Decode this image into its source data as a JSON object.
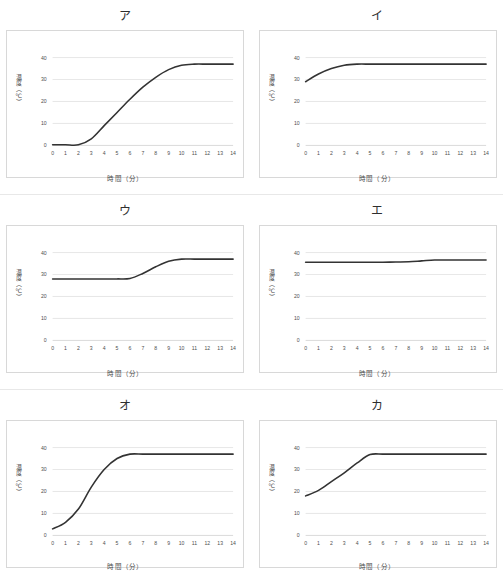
{
  "page": {
    "background_color": "#ffffff",
    "series_color": "#333333",
    "grid_color": "#d6d6d6",
    "panel_border_color": "#d8d8d8"
  },
  "common": {
    "xlabel": "時間（分）",
    "ylabel": "温度（℃）",
    "x_ticks": [
      "0",
      "1",
      "2",
      "3",
      "4",
      "5",
      "6",
      "7",
      "8",
      "9",
      "10",
      "11",
      "12",
      "13",
      "14"
    ],
    "y_ticks": [
      "0",
      "10",
      "20",
      "30",
      "40"
    ]
  },
  "chart_data": [
    {
      "type": "line",
      "title": "ア",
      "xlabel": "時間（分）",
      "ylabel": "温度（℃）",
      "xlim": [
        0,
        14
      ],
      "ylim": [
        0,
        44
      ],
      "xticks": [
        0,
        1,
        2,
        3,
        4,
        5,
        6,
        7,
        8,
        9,
        10,
        11,
        12,
        13,
        14
      ],
      "yticks": [
        0,
        10,
        20,
        30,
        40
      ],
      "grid": true,
      "legend": "none",
      "x": [
        0,
        1,
        2,
        3,
        4,
        5,
        6,
        7,
        8,
        9,
        10,
        11,
        12,
        13,
        14
      ],
      "values": [
        0.3,
        0.3,
        0.3,
        3.0,
        9.0,
        15.0,
        21.0,
        26.5,
        31.0,
        34.5,
        36.5,
        37.0,
        37.0,
        37.0,
        37.0
      ]
    },
    {
      "type": "line",
      "title": "イ",
      "xlabel": "時間（分）",
      "ylabel": "温度（℃）",
      "xlim": [
        0,
        14
      ],
      "ylim": [
        0,
        44
      ],
      "xticks": [
        0,
        1,
        2,
        3,
        4,
        5,
        6,
        7,
        8,
        9,
        10,
        11,
        12,
        13,
        14
      ],
      "yticks": [
        0,
        10,
        20,
        30,
        40
      ],
      "grid": true,
      "legend": "none",
      "x": [
        0,
        1,
        2,
        3,
        4,
        5,
        6,
        7,
        8,
        9,
        10,
        11,
        12,
        13,
        14
      ],
      "values": [
        29.0,
        32.5,
        35.0,
        36.5,
        37.0,
        37.0,
        37.0,
        37.0,
        37.0,
        37.0,
        37.0,
        37.0,
        37.0,
        37.0,
        37.0
      ]
    },
    {
      "type": "line",
      "title": "ウ",
      "xlabel": "時間（分）",
      "ylabel": "温度（℃）",
      "xlim": [
        0,
        14
      ],
      "ylim": [
        0,
        44
      ],
      "xticks": [
        0,
        1,
        2,
        3,
        4,
        5,
        6,
        7,
        8,
        9,
        10,
        11,
        12,
        13,
        14
      ],
      "yticks": [
        0,
        10,
        20,
        30,
        40
      ],
      "grid": true,
      "legend": "none",
      "x": [
        0,
        1,
        2,
        3,
        4,
        5,
        6,
        7,
        8,
        9,
        10,
        11,
        12,
        13,
        14
      ],
      "values": [
        28.0,
        28.0,
        28.0,
        28.0,
        28.0,
        28.0,
        28.2,
        30.5,
        33.5,
        36.0,
        37.0,
        37.0,
        37.0,
        37.0,
        37.0
      ]
    },
    {
      "type": "line",
      "title": "エ",
      "xlabel": "時間（分）",
      "ylabel": "温度（℃）",
      "xlim": [
        0,
        14
      ],
      "ylim": [
        0,
        44
      ],
      "xticks": [
        0,
        1,
        2,
        3,
        4,
        5,
        6,
        7,
        8,
        9,
        10,
        11,
        12,
        13,
        14
      ],
      "yticks": [
        0,
        10,
        20,
        30,
        40
      ],
      "grid": true,
      "legend": "none",
      "x": [
        0,
        1,
        2,
        3,
        4,
        5,
        6,
        7,
        8,
        9,
        10,
        11,
        12,
        13,
        14
      ],
      "values": [
        35.6,
        35.6,
        35.6,
        35.6,
        35.6,
        35.6,
        35.6,
        35.7,
        35.8,
        36.2,
        36.6,
        36.6,
        36.6,
        36.6,
        36.6
      ]
    },
    {
      "type": "line",
      "title": "オ",
      "xlabel": "時間（分）",
      "ylabel": "温度（℃）",
      "xlim": [
        0,
        14
      ],
      "ylim": [
        0,
        44
      ],
      "xticks": [
        0,
        1,
        2,
        3,
        4,
        5,
        6,
        7,
        8,
        9,
        10,
        11,
        12,
        13,
        14
      ],
      "yticks": [
        0,
        10,
        20,
        30,
        40
      ],
      "grid": true,
      "legend": "none",
      "x": [
        0,
        1,
        2,
        3,
        4,
        5,
        6,
        7,
        8,
        9,
        10,
        11,
        12,
        13,
        14
      ],
      "values": [
        3.0,
        6.0,
        12.0,
        22.0,
        30.0,
        35.0,
        37.0,
        37.0,
        37.0,
        37.0,
        37.0,
        37.0,
        37.0,
        37.0,
        37.0
      ]
    },
    {
      "type": "line",
      "title": "カ",
      "xlabel": "時間（分）",
      "ylabel": "温度（℃）",
      "xlim": [
        0,
        14
      ],
      "ylim": [
        0,
        44
      ],
      "xticks": [
        0,
        1,
        2,
        3,
        4,
        5,
        6,
        7,
        8,
        9,
        10,
        11,
        12,
        13,
        14
      ],
      "yticks": [
        0,
        10,
        20,
        30,
        40
      ],
      "grid": true,
      "legend": "none",
      "x": [
        0,
        1,
        2,
        3,
        4,
        5,
        6,
        7,
        8,
        9,
        10,
        11,
        12,
        13,
        14
      ],
      "values": [
        18.0,
        20.5,
        24.5,
        28.5,
        33.0,
        36.8,
        37.0,
        37.0,
        37.0,
        37.0,
        37.0,
        37.0,
        37.0,
        37.0,
        37.0
      ]
    }
  ]
}
